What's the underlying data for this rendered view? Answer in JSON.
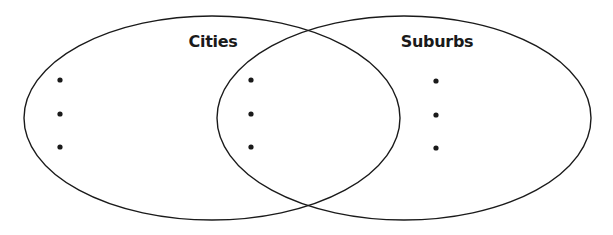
{
  "diagram": {
    "type": "venn",
    "sets": [
      {
        "id": "cities",
        "label": "Cities",
        "ellipse": {
          "cx": 212,
          "cy": 118,
          "rx": 188,
          "ry": 102
        },
        "label_pos": {
          "x": 213,
          "y": 47
        },
        "bullets": [
          {
            "x": 60,
            "y": 80
          },
          {
            "x": 60,
            "y": 114
          },
          {
            "x": 60,
            "y": 147
          }
        ]
      },
      {
        "id": "suburbs",
        "label": "Suburbs",
        "ellipse": {
          "cx": 404,
          "cy": 118,
          "rx": 187,
          "ry": 102
        },
        "label_pos": {
          "x": 437,
          "y": 47
        },
        "bullets": [
          {
            "x": 436,
            "y": 81
          },
          {
            "x": 436,
            "y": 115
          },
          {
            "x": 436,
            "y": 148
          }
        ]
      }
    ],
    "intersection": {
      "id": "both",
      "bullets": [
        {
          "x": 251,
          "y": 80
        },
        {
          "x": 251,
          "y": 114
        },
        {
          "x": 251,
          "y": 147
        }
      ]
    },
    "colors": {
      "stroke": "#1a1a1a",
      "text": "#1a1a1a",
      "background": "#ffffff"
    }
  }
}
